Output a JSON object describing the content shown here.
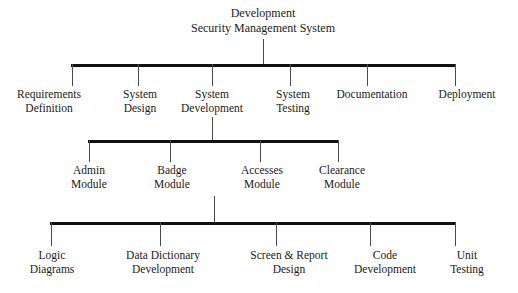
{
  "diagram": {
    "title_line1": "Development",
    "title_line2": "Security Management System",
    "level2": [
      {
        "line1": "Requirements",
        "line2": "Definition"
      },
      {
        "line1": "System",
        "line2": "Design"
      },
      {
        "line1": "System",
        "line2": "Development"
      },
      {
        "line1": "System",
        "line2": "Testing"
      },
      {
        "line1": "Documentation",
        "line2": ""
      },
      {
        "line1": "Deployment",
        "line2": ""
      }
    ],
    "level3": [
      {
        "line1": "Admin",
        "line2": "Module"
      },
      {
        "line1": "Badge",
        "line2": "Module"
      },
      {
        "line1": "Accesses",
        "line2": "Module"
      },
      {
        "line1": "Clearance",
        "line2": "Module"
      }
    ],
    "level4": [
      {
        "line1": "Logic",
        "line2": "Diagrams"
      },
      {
        "line1": "Data Dictionary",
        "line2": "Development"
      },
      {
        "line1": "Screen & Report",
        "line2": "Design"
      },
      {
        "line1": "Code",
        "line2": "Development"
      },
      {
        "line1": "Unit",
        "line2": "Testing"
      }
    ],
    "colors": {
      "bar": "#111111",
      "connector": "#4a4a4a",
      "text": "#1a1a1a",
      "background": "#ffffff"
    }
  }
}
